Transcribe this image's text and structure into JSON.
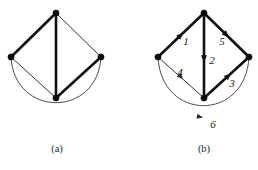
{
  "figure": {
    "background_color": "#ffffff",
    "ink_color": "#111111",
    "panels": [
      {
        "id": "panel-a",
        "caption": "(a)",
        "caption_x": 57,
        "caption_y": 150,
        "description": "undirected graph",
        "vertices": [
          {
            "name": "top",
            "x": 56,
            "y": 13,
            "r": 3.1
          },
          {
            "name": "left",
            "x": 11,
            "y": 57,
            "r": 3.1
          },
          {
            "name": "right",
            "x": 101,
            "y": 57,
            "r": 3.1
          },
          {
            "name": "bottom",
            "x": 56,
            "y": 98,
            "r": 3.1
          }
        ],
        "edges": [
          {
            "name": "left-top",
            "from": "left",
            "to": "top",
            "weight": "thick",
            "label": ""
          },
          {
            "name": "top-right",
            "from": "top",
            "to": "right",
            "weight": "thin",
            "label": ""
          },
          {
            "name": "top-bottom",
            "from": "top",
            "to": "bottom",
            "weight": "thick",
            "label": ""
          },
          {
            "name": "left-bottom",
            "from": "left",
            "to": "bottom",
            "weight": "thin",
            "label": ""
          },
          {
            "name": "bottom-right",
            "from": "bottom",
            "to": "right",
            "weight": "thick",
            "label": ""
          }
        ],
        "curve": {
          "name": "left-right-arc",
          "path": "M 11 57 C 14 118, 98 118, 101 57",
          "weight": "thin",
          "label": ""
        }
      },
      {
        "id": "panel-b",
        "caption": "(b)",
        "caption_x": 204,
        "caption_y": 150,
        "description": "directed graph with numbered edges",
        "vertices": [
          {
            "name": "top",
            "x": 204,
            "y": 13,
            "r": 3.1
          },
          {
            "name": "left",
            "x": 158,
            "y": 57,
            "r": 3.1
          },
          {
            "name": "right",
            "x": 249,
            "y": 57,
            "r": 3.1
          },
          {
            "name": "bottom",
            "x": 204,
            "y": 98,
            "r": 3.1
          }
        ],
        "edges": [
          {
            "name": "edge-1",
            "from": "left",
            "to": "top",
            "weight": "thick",
            "label": "1",
            "label_x": 186,
            "label_y": 42,
            "arrow_t": 0.55
          },
          {
            "name": "edge-5",
            "from": "top",
            "to": "right",
            "weight": "thick",
            "label": "5",
            "label_x": 222,
            "label_y": 42,
            "arrow_t": 0.55
          },
          {
            "name": "edge-2",
            "from": "top",
            "to": "bottom",
            "weight": "thick",
            "label": "2",
            "label_x": 212,
            "label_y": 61,
            "arrow_t": 0.58
          },
          {
            "name": "edge-4",
            "from": "left",
            "to": "bottom",
            "weight": "thin",
            "label": "4",
            "label_x": 180,
            "label_y": 73,
            "arrow_t": 0.55
          },
          {
            "name": "edge-3",
            "from": "bottom",
            "to": "right",
            "weight": "thick",
            "label": "3",
            "label_x": 232,
            "label_y": 84,
            "arrow_t": 0.6
          }
        ],
        "curve": {
          "name": "edge-6",
          "path": "M 158 57 C 161 122, 246 122, 249 57",
          "weight": "thin",
          "label": "6",
          "label_x": 213,
          "label_y": 125,
          "arrow_x": 200,
          "arrow_y": 117,
          "arrow_angle": 12
        }
      }
    ]
  }
}
